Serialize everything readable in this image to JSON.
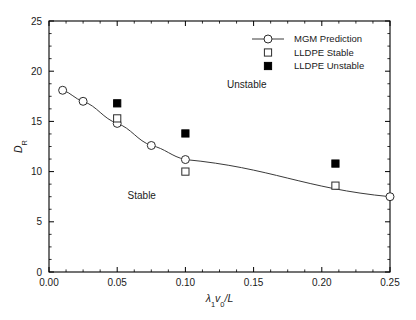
{
  "figure": {
    "background": "#ffffff",
    "frame_color": "#000000",
    "curve_color": "#3a3a3a",
    "marker_open_fill": "#ffffff",
    "marker_filled_fill": "#000000"
  },
  "chart_data": {
    "type": "scatter",
    "title": "",
    "xlabel": "λ₁v₀/L",
    "ylabel": "D_R",
    "xlabel_parts": {
      "lambda": "λ",
      "lambda_sub": "1",
      "v": "v",
      "v_sub": "0",
      "slash_l": "/L"
    },
    "ylabel_parts": {
      "d": "D",
      "d_sub": "R"
    },
    "xlim": [
      0.0,
      0.25
    ],
    "ylim": [
      0,
      25
    ],
    "xticks": [
      0.0,
      0.05,
      0.1,
      0.15,
      0.2,
      0.25
    ],
    "xtick_labels": [
      "0.00",
      "0.05",
      "0.10",
      "0.15",
      "0.20",
      "0.25"
    ],
    "yticks": [
      0,
      5,
      10,
      15,
      20,
      25
    ],
    "ytick_labels": [
      "0",
      "5",
      "10",
      "15",
      "20",
      "25"
    ],
    "x_minor_step": 0.0125,
    "y_minor_step": 1.25,
    "grid": false,
    "legend_position": "upper right",
    "series": [
      {
        "name": "MGM Prediction",
        "marker": "open-circle",
        "line": true,
        "x": [
          0.01,
          0.025,
          0.05,
          0.075,
          0.1,
          0.25
        ],
        "y": [
          18.1,
          17.0,
          14.8,
          12.6,
          11.2,
          7.5
        ]
      },
      {
        "name": "LLDPE Stable",
        "marker": "open-square",
        "line": false,
        "x": [
          0.05,
          0.1,
          0.21
        ],
        "y": [
          15.3,
          10.0,
          8.6
        ]
      },
      {
        "name": "LLDPE Unstable",
        "marker": "filled-square",
        "line": false,
        "x": [
          0.05,
          0.1,
          0.21
        ],
        "y": [
          16.8,
          13.8,
          10.8
        ]
      }
    ],
    "annotations": [
      {
        "text": "Unstable",
        "x": 0.145,
        "y": 18.3
      },
      {
        "text": "Stable",
        "x": 0.068,
        "y": 7.3
      }
    ],
    "legend_entries": [
      {
        "label": "MGM Prediction",
        "marker": "open-circle-line"
      },
      {
        "label": "LLDPE Stable",
        "marker": "open-square"
      },
      {
        "label": "LLDPE Unstable",
        "marker": "filled-square"
      }
    ]
  }
}
